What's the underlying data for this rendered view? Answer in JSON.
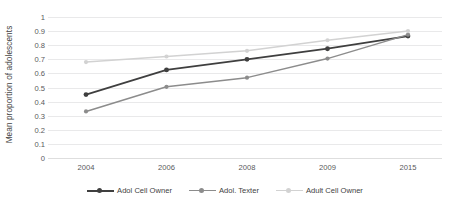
{
  "chart_data": {
    "type": "line",
    "title": "",
    "xlabel": "",
    "ylabel": "Mean proportion of adolescents",
    "categories": [
      "2004",
      "2006",
      "2008",
      "2009",
      "2015"
    ],
    "ylim": [
      0,
      1
    ],
    "yticks": [
      "1",
      "0.9",
      "0.8",
      "0.7",
      "0.6",
      "0.5",
      "0.4",
      "0.3",
      "0.2",
      "0.1",
      "0"
    ],
    "ytick_values": [
      1,
      0.9,
      0.8,
      0.7,
      0.6,
      0.5,
      0.4,
      0.3,
      0.2,
      0.1,
      0
    ],
    "grid": true,
    "legend_position": "bottom",
    "series": [
      {
        "name": "Adol Cell Owner",
        "color": "#3f3f3f",
        "marker": "circle",
        "values": [
          0.45,
          0.625,
          0.7,
          0.775,
          0.865
        ]
      },
      {
        "name": "Adol. Texter",
        "color": "#8c8c8c",
        "marker": "circle",
        "values": [
          0.33,
          0.505,
          0.57,
          0.705,
          0.875
        ]
      },
      {
        "name": "Adult Cell Owner",
        "color": "#d2d2d2",
        "marker": "circle",
        "values": [
          0.68,
          0.72,
          0.76,
          0.835,
          0.9
        ]
      }
    ]
  },
  "colors": {
    "background": "#ffffff",
    "gridline": "#e9e9ea",
    "axis_text": "#59595b",
    "title_text": "#434343"
  }
}
